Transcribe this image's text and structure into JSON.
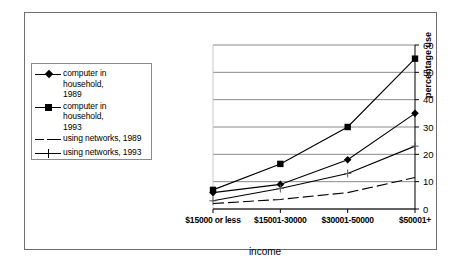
{
  "chart_data": {
    "type": "line",
    "title": "",
    "xlabel": "income",
    "ylabel": "percentage use",
    "categories": [
      "$15000 or less",
      "$15001-30000",
      "$30001-50000",
      "$50001+"
    ],
    "ylim": [
      0,
      60
    ],
    "yticks": [
      0,
      10,
      20,
      30,
      40,
      50,
      60
    ],
    "grid": "horizontal",
    "y_axis_position": "right",
    "legend_position": "left-outside",
    "series": [
      {
        "name": "computer in household, 1989",
        "marker": "diamond",
        "linestyle": "solid",
        "values": [
          6,
          9,
          18,
          35
        ]
      },
      {
        "name": "computer in household, 1993",
        "marker": "square",
        "linestyle": "solid",
        "values": [
          7,
          16.5,
          30,
          55
        ]
      },
      {
        "name": "using networks, 1989",
        "marker": "none",
        "linestyle": "dashed",
        "values": [
          2,
          3.5,
          6,
          11.5
        ]
      },
      {
        "name": "using networks, 1993",
        "marker": "cross",
        "linestyle": "solid",
        "values": [
          3,
          7.5,
          13,
          23
        ]
      }
    ]
  },
  "legend": {
    "entries": [
      {
        "label": "computer in household,\n1989",
        "marker": "diamond"
      },
      {
        "label": "computer in household,\n1993",
        "marker": "square"
      },
      {
        "label": "using networks, 1989",
        "marker": "dash"
      },
      {
        "label": "using networks, 1993",
        "marker": "cross"
      }
    ]
  },
  "axes": {
    "y_tick_labels": [
      "60",
      "50",
      "40",
      "30",
      "20",
      "10",
      "0"
    ],
    "x_tick_labels": [
      "$15000 or less",
      "$15001-30000",
      "$30001-50000",
      "$50001+"
    ],
    "x_title": "income",
    "y_title": "percentage use"
  },
  "colors": {
    "ink": "#000000",
    "grid": "#8a8a8a",
    "frame": "#6f6f6f",
    "background": "#ffffff"
  }
}
